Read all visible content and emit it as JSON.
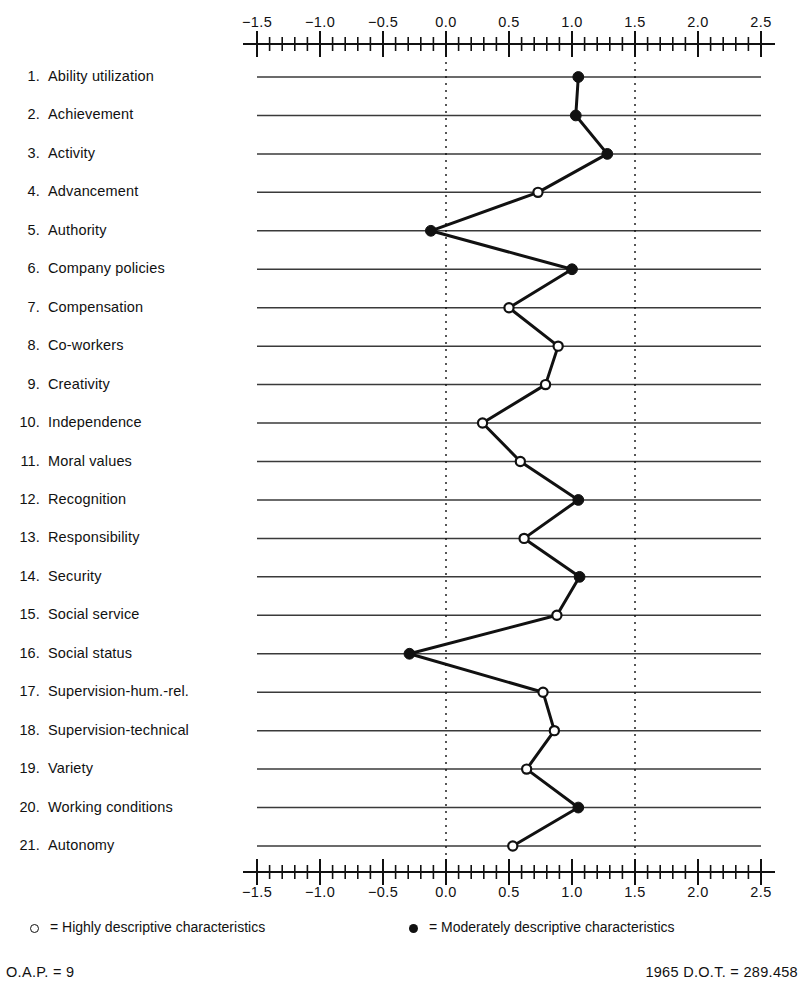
{
  "chart_data": {
    "type": "line",
    "title": "",
    "subtitle": "",
    "xlabel": "",
    "ylabel": "",
    "orientation": "horizontal",
    "xlim": [
      -1.5,
      2.5
    ],
    "xticks": [
      -1.5,
      -1.0,
      -0.5,
      0.0,
      0.5,
      1.0,
      1.5,
      2.0,
      2.5
    ],
    "xtick_labels": [
      "−1.5",
      "−1.0",
      "−0.5",
      "0.0",
      "0.5",
      "1.0",
      "1.5",
      "2.0",
      "2.5"
    ],
    "minor_tick_step": 0.1,
    "grid": "horizontal-solid-rows",
    "reference_lines": [
      0.0,
      1.5
    ],
    "reference_line_style": "dotted",
    "axis_position": [
      "top",
      "bottom"
    ],
    "categories": [
      "Ability utilization",
      "Achievement",
      "Activity",
      "Advancement",
      "Authority",
      "Company policies",
      "Compensation",
      "Co-workers",
      "Creativity",
      "Independence",
      "Moral values",
      "Recognition",
      "Responsibility",
      "Security",
      "Social service",
      "Social status",
      "Supervision-hum.-rel.",
      "Supervision-technical",
      "Variety",
      "Working conditions",
      "Autonomy"
    ],
    "values": [
      1.05,
      1.03,
      1.28,
      0.73,
      -0.12,
      1.0,
      0.5,
      0.89,
      0.79,
      0.29,
      0.59,
      1.05,
      0.62,
      1.06,
      0.88,
      -0.29,
      0.77,
      0.86,
      0.64,
      1.05,
      0.53
    ],
    "marker_types": [
      "filled",
      "filled",
      "filled",
      "open",
      "filled",
      "filled",
      "open",
      "open",
      "open",
      "open",
      "open",
      "filled",
      "open",
      "filled",
      "open",
      "filled",
      "open",
      "open",
      "open",
      "filled",
      "open"
    ],
    "series": [
      {
        "name": "Occupational Reinforcer Pattern",
        "values": [
          1.05,
          1.03,
          1.28,
          0.73,
          -0.12,
          1.0,
          0.5,
          0.89,
          0.79,
          0.29,
          0.59,
          1.05,
          0.62,
          1.06,
          0.88,
          -0.29,
          0.77,
          0.86,
          0.64,
          1.05,
          0.53
        ]
      }
    ]
  },
  "rows": [
    {
      "num": "1.",
      "label": "Ability utilization",
      "value": 1.05,
      "marker": "filled"
    },
    {
      "num": "2.",
      "label": "Achievement",
      "value": 1.03,
      "marker": "filled"
    },
    {
      "num": "3.",
      "label": "Activity",
      "value": 1.28,
      "marker": "filled"
    },
    {
      "num": "4.",
      "label": "Advancement",
      "value": 0.73,
      "marker": "open"
    },
    {
      "num": "5.",
      "label": "Authority",
      "value": -0.12,
      "marker": "filled"
    },
    {
      "num": "6.",
      "label": "Company policies",
      "value": 1.0,
      "marker": "filled"
    },
    {
      "num": "7.",
      "label": "Compensation",
      "value": 0.5,
      "marker": "open"
    },
    {
      "num": "8.",
      "label": "Co-workers",
      "value": 0.89,
      "marker": "open"
    },
    {
      "num": "9.",
      "label": "Creativity",
      "value": 0.79,
      "marker": "open"
    },
    {
      "num": "10.",
      "label": "Independence",
      "value": 0.29,
      "marker": "open"
    },
    {
      "num": "11.",
      "label": "Moral values",
      "value": 0.59,
      "marker": "open"
    },
    {
      "num": "12.",
      "label": "Recognition",
      "value": 1.05,
      "marker": "filled"
    },
    {
      "num": "13.",
      "label": "Responsibility",
      "value": 0.62,
      "marker": "open"
    },
    {
      "num": "14.",
      "label": "Security",
      "value": 1.06,
      "marker": "filled"
    },
    {
      "num": "15.",
      "label": "Social service",
      "value": 0.88,
      "marker": "open"
    },
    {
      "num": "16.",
      "label": "Social status",
      "value": -0.29,
      "marker": "filled"
    },
    {
      "num": "17.",
      "label": "Supervision-hum.-rel.",
      "value": 0.77,
      "marker": "open"
    },
    {
      "num": "18.",
      "label": "Supervision-technical",
      "value": 0.86,
      "marker": "open"
    },
    {
      "num": "19.",
      "label": "Variety",
      "value": 0.64,
      "marker": "open"
    },
    {
      "num": "20.",
      "label": "Working conditions",
      "value": 1.05,
      "marker": "filled"
    },
    {
      "num": "21.",
      "label": "Autonomy",
      "value": 0.53,
      "marker": "open"
    }
  ],
  "axis": {
    "tick_labels": [
      "−1.5",
      "−1.0",
      "−0.5",
      "0.0",
      "0.5",
      "1.0",
      "1.5",
      "2.0",
      "2.5"
    ],
    "tick_values": [
      -1.5,
      -1.0,
      -0.5,
      0.0,
      0.5,
      1.0,
      1.5,
      2.0,
      2.5
    ]
  },
  "legend": {
    "open_marker_icon": "open-circle",
    "open_label": "= Highly descriptive characteristics",
    "filled_marker_icon": "filled-circle",
    "filled_label": "= Moderately descriptive characteristics"
  },
  "footer": {
    "left": "O.A.P. = 9",
    "right": "1965 D.O.T. = 289.458"
  },
  "colors": {
    "ink": "#111111",
    "rule": "#3a3a3a",
    "background": "#ffffff"
  }
}
